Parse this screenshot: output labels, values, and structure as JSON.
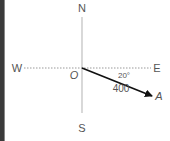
{
  "diagram": {
    "type": "compass-vector",
    "compass": {
      "north": "N",
      "south": "S",
      "east": "E",
      "west": "W"
    },
    "origin_label": "O",
    "vector": {
      "label": "A",
      "magnitude": "400",
      "angle": "20°",
      "direction": "20° south of east"
    },
    "colors": {
      "axis": "#b0b0b0",
      "vector": "#111111",
      "text": "#555555",
      "frame": "#3a3a3a"
    }
  }
}
